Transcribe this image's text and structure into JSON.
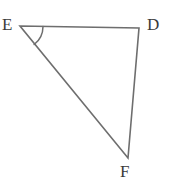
{
  "figure": {
    "kind": "geometry-triangle",
    "background_color": "#ffffff",
    "stroke_color": "#6e6e6e",
    "label_color": "#3a3a3a",
    "stroke_width": 1.6,
    "canvas": {
      "width": 173,
      "height": 189
    },
    "vertices": [
      {
        "id": "E",
        "label": "E",
        "x": 20,
        "y": 26,
        "label_x": 2,
        "label_y": 16
      },
      {
        "id": "D",
        "label": "D",
        "x": 139,
        "y": 28,
        "label_x": 147,
        "label_y": 16
      },
      {
        "id": "F",
        "label": "F",
        "x": 128,
        "y": 158,
        "label_x": 120,
        "label_y": 163
      }
    ],
    "sides": [
      {
        "id": "ED",
        "from": "E",
        "to": "D"
      },
      {
        "id": "DF",
        "from": "D",
        "to": "F"
      },
      {
        "id": "FE",
        "from": "F",
        "to": "E"
      }
    ],
    "angle_marks": [
      {
        "id": "angle-E",
        "at": "E",
        "radius": 23,
        "path": "M 43 26.4 A 23 23 0 0 1 34.15 44.5"
      }
    ],
    "polygon_points": "20,26 139,28 128,158"
  }
}
